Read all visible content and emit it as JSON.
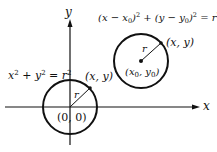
{
  "axes": {
    "x_label": "x",
    "y_label": "y"
  },
  "circle_origin": {
    "equation": {
      "base_x": "x",
      "exp_x": "2",
      "plus": " + ",
      "base_y": "y",
      "exp_y": "2",
      "eq": " = ",
      "base_r": "r",
      "exp_r": "2"
    },
    "center_label": "(0, 0)",
    "point_label": "(x, y)",
    "radius_label": "r"
  },
  "circle_shifted": {
    "equation": {
      "open1": "(x − x",
      "sub1": "0",
      "close1": ")",
      "exp1": "2",
      "plus": " + ",
      "open2": "(y − y",
      "sub2": "0",
      "close2": ")",
      "exp2": "2",
      "eq": " = ",
      "base_r": "r",
      "exp_r": "2"
    },
    "center_label": {
      "open": "(x",
      "sub1": "0",
      "mid": ", y",
      "sub2": "0",
      "close": ")"
    },
    "point_label": "(x, y)",
    "radius_label": "r"
  },
  "colors": {
    "stroke": "#111111",
    "background": "#ffffff"
  }
}
